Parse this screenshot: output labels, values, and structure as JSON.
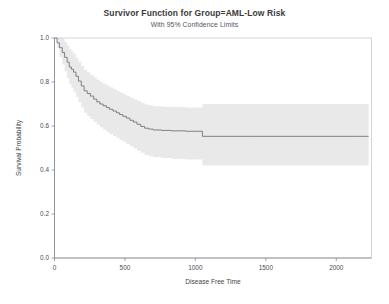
{
  "chart_data": {
    "type": "line",
    "title": "Survivor Function for Group=AML-Low Risk",
    "subtitle": "With 95% Confidence Limits",
    "xlabel": "Disease Free Time",
    "ylabel": "Survival Probability",
    "xlim": [
      0,
      2250
    ],
    "ylim": [
      0.0,
      1.0
    ],
    "xticks": [
      0,
      500,
      1000,
      1500,
      2000
    ],
    "xtick_labels": [
      "0",
      "500",
      "1000",
      "1500",
      "2000"
    ],
    "yticks": [
      0.0,
      0.2,
      0.4,
      0.6,
      0.8,
      1.0
    ],
    "ytick_labels": [
      "0.0",
      "0.2",
      "0.4",
      "0.6",
      "0.8",
      "1.0"
    ],
    "grid": false,
    "legend": "none",
    "line_color": "#6e6e74",
    "band_color": "#e9e9ea",
    "axis_color": "#7a7a80",
    "series": [
      {
        "name": "Survivor Function",
        "step": "post",
        "x": [
          0,
          18,
          35,
          55,
          72,
          90,
          105,
          120,
          135,
          152,
          170,
          190,
          210,
          232,
          255,
          278,
          300,
          322,
          345,
          368,
          390,
          415,
          440,
          462,
          485,
          510,
          535,
          560,
          585,
          612,
          640,
          668,
          700,
          760,
          830,
          930,
          1050,
          1400,
          1750,
          2150,
          2230
        ],
        "y": [
          1.0,
          0.978,
          0.956,
          0.934,
          0.912,
          0.89,
          0.868,
          0.858,
          0.845,
          0.826,
          0.804,
          0.782,
          0.76,
          0.748,
          0.736,
          0.722,
          0.71,
          0.7,
          0.692,
          0.684,
          0.676,
          0.668,
          0.66,
          0.652,
          0.644,
          0.636,
          0.626,
          0.618,
          0.608,
          0.598,
          0.59,
          0.586,
          0.582,
          0.58,
          0.578,
          0.576,
          0.553,
          0.553,
          0.553,
          0.553,
          0.553
        ]
      },
      {
        "name": "Upper 95% Confidence Limit",
        "step": "post",
        "x": [
          0,
          18,
          35,
          55,
          72,
          90,
          105,
          120,
          135,
          152,
          170,
          190,
          210,
          232,
          255,
          278,
          300,
          322,
          345,
          368,
          390,
          415,
          440,
          462,
          485,
          510,
          535,
          560,
          585,
          612,
          640,
          668,
          700,
          760,
          830,
          930,
          1050,
          1400,
          1750,
          2150,
          2230
        ],
        "y": [
          1.0,
          1.0,
          1.0,
          0.996,
          0.982,
          0.966,
          0.95,
          0.94,
          0.928,
          0.91,
          0.892,
          0.874,
          0.856,
          0.844,
          0.832,
          0.82,
          0.81,
          0.8,
          0.792,
          0.784,
          0.776,
          0.768,
          0.76,
          0.752,
          0.746,
          0.738,
          0.73,
          0.722,
          0.714,
          0.706,
          0.698,
          0.694,
          0.69,
          0.688,
          0.686,
          0.684,
          0.7,
          0.7,
          0.7,
          0.7,
          0.7
        ]
      },
      {
        "name": "Lower 95% Confidence Limit",
        "step": "post",
        "x": [
          0,
          18,
          35,
          55,
          72,
          90,
          105,
          120,
          135,
          152,
          170,
          190,
          210,
          232,
          255,
          278,
          300,
          322,
          345,
          368,
          390,
          415,
          440,
          462,
          485,
          510,
          535,
          560,
          585,
          612,
          640,
          668,
          700,
          760,
          830,
          930,
          1050,
          1400,
          1750,
          2150,
          2230
        ],
        "y": [
          1.0,
          0.954,
          0.914,
          0.88,
          0.848,
          0.818,
          0.79,
          0.774,
          0.756,
          0.732,
          0.708,
          0.684,
          0.66,
          0.646,
          0.632,
          0.618,
          0.606,
          0.594,
          0.584,
          0.574,
          0.564,
          0.554,
          0.546,
          0.536,
          0.528,
          0.518,
          0.508,
          0.498,
          0.488,
          0.478,
          0.468,
          0.462,
          0.458,
          0.454,
          0.45,
          0.448,
          0.42,
          0.42,
          0.42,
          0.42,
          0.42
        ]
      }
    ]
  }
}
